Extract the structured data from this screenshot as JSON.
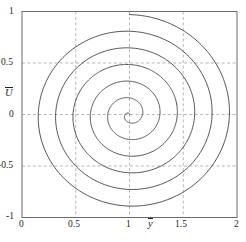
{
  "chart_data": {
    "type": "line",
    "title": "",
    "subtitle": "",
    "xlabel": "ȳ",
    "ylabel": "Ū",
    "xlim": [
      0,
      2
    ],
    "ylim": [
      -1,
      1
    ],
    "xticks": [
      0,
      0.5,
      1,
      1.5,
      2
    ],
    "xticklabels": [
      "0",
      "0.5",
      "1",
      "1.5",
      "2"
    ],
    "yticks": [
      -1,
      -0.5,
      0,
      0.5,
      1
    ],
    "yticklabels": [
      "-1",
      "-0.5",
      "0",
      "0.5",
      "1"
    ],
    "grid": true,
    "grid_style": "dashed",
    "legend": null,
    "series": [
      {
        "name": "spiral",
        "description": "Archimedean spiral centered at (1, 0), wound clockwise from outer radius ~0.97 inward to 0 over about 6 turns",
        "center": [
          1.0,
          0.0
        ],
        "r_start": 0.97,
        "r_end": 0.0,
        "turns": 6,
        "theta_start_deg": 90,
        "direction": "clockwise",
        "crossings_x_equals_1_upper": [
          0.97,
          0.81,
          0.65,
          0.48,
          0.31,
          0.13
        ],
        "crossings_x_equals_1_lower": [
          -0.06,
          -0.22,
          -0.39,
          -0.55,
          -0.71,
          -0.88
        ],
        "crossings_y_equals_0_right": [
          1.9,
          1.74,
          1.57,
          1.4,
          1.23,
          1.06
        ],
        "crossings_y_equals_0_left": [
          0.0,
          0.15,
          0.31,
          0.48,
          0.65,
          0.82
        ]
      }
    ],
    "colors": {
      "curve": "#3f3f3f",
      "axis": "#6b6b6b",
      "grid": "#9a9a9a",
      "text": "#231f20",
      "background": "#ffffff"
    }
  },
  "axes": {
    "x_tick_labels": [
      "0",
      "0.5",
      "1",
      "1.5",
      "2"
    ],
    "y_tick_labels": [
      "1",
      "0.5",
      "0",
      "-0.5",
      "-1"
    ],
    "x_title": "y",
    "y_title": "U"
  }
}
